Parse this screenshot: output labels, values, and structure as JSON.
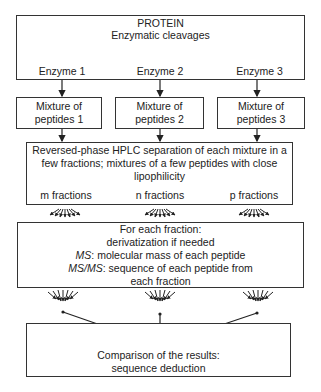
{
  "diagram": {
    "top_box": {
      "line1": "PROTEIN",
      "line2": "Enzymatic cleavages"
    },
    "enzymes": [
      "Enzyme 1",
      "Enzyme 2",
      "Enzyme 3"
    ],
    "mixtures": [
      {
        "line1": "Mixture of",
        "line2": "peptides 1"
      },
      {
        "line1": "Mixture of",
        "line2": "peptides 2"
      },
      {
        "line1": "Mixture of",
        "line2": "peptides 3"
      }
    ],
    "hplc_box": {
      "line1": "Reversed-phase HPLC separation of each mixture in a",
      "line2": "few fractions; mixtures of a few peptides with close",
      "line3": "lipophilicity"
    },
    "fractions": [
      "m fractions",
      "n fractions",
      "p fractions"
    ],
    "fraction_box": {
      "line1": "For each fraction:",
      "line2": "derivatization if needed",
      "ms_label": "MS",
      "ms_text": ": molecular mass of each peptide",
      "msms_label": "MS/MS",
      "msms_text": ": sequence of each peptide from",
      "line5": "each fraction"
    },
    "result_box": {
      "line1": "Comparison of the results:",
      "line2": "sequence deduction"
    }
  }
}
